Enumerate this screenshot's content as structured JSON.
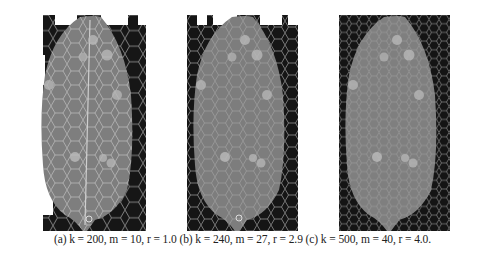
{
  "figure": {
    "panels": [
      {
        "label": "(a)",
        "k": "200",
        "m": "10",
        "r": "1.0",
        "caption_text": "(a) k = 200, m = 10, r = 1.0"
      },
      {
        "label": "(b)",
        "k": "240",
        "m": "27",
        "r": "2.9",
        "caption_text": "(b) k = 240, m = 27, r = 2.9"
      },
      {
        "label": "(c)",
        "k": "500",
        "m": "40",
        "r": "4.0",
        "caption_text": "(c) k = 500, m = 40, r = 4.0."
      }
    ],
    "colors": {
      "background": "#1a1a1a",
      "organ_fill": "#7d7d7d",
      "grid_line": "#b9b9b9",
      "white": "#ffffff"
    }
  }
}
